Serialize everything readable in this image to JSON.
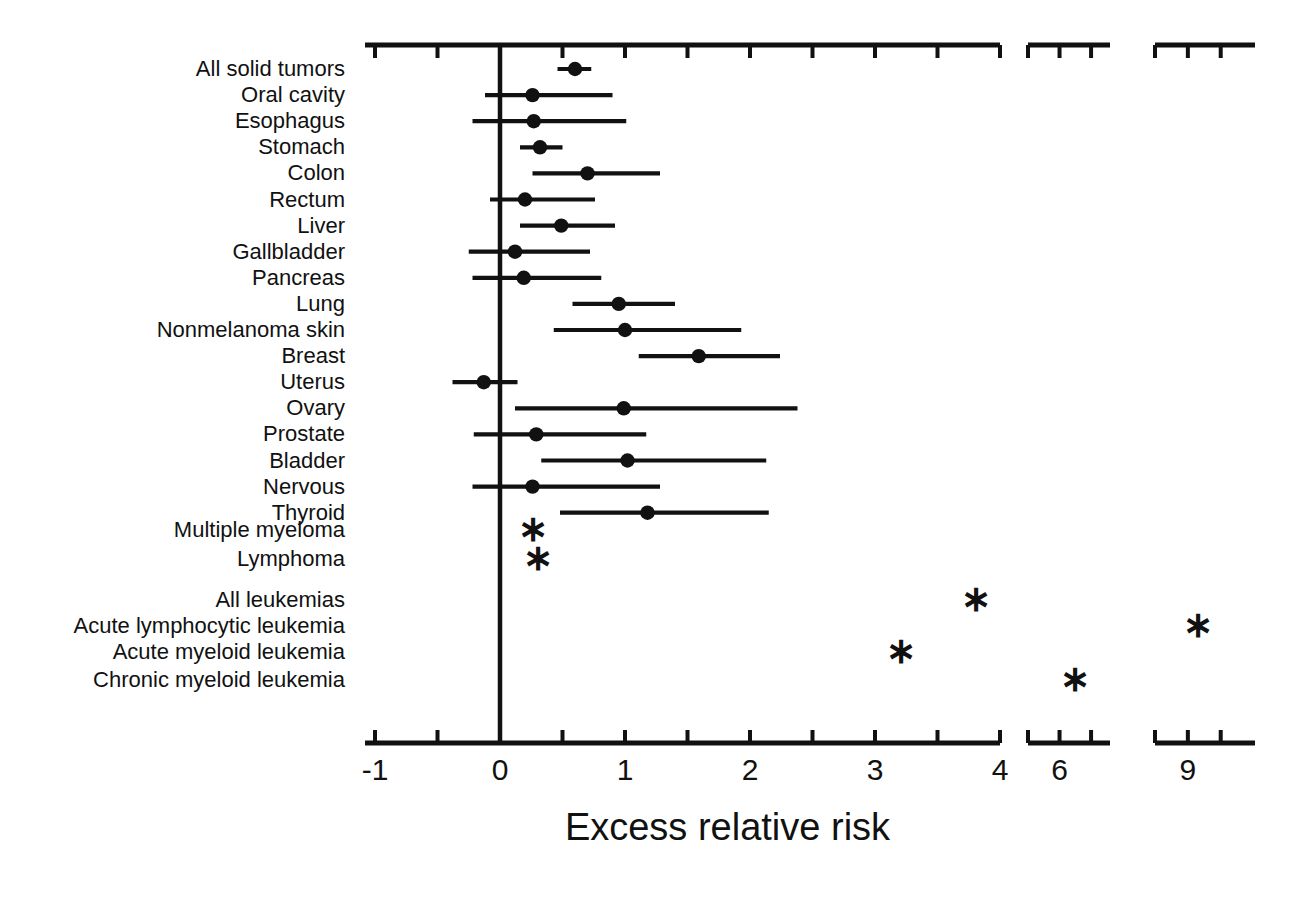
{
  "chart_data": {
    "type": "forest",
    "title": "",
    "xlabel": "Excess relative risk",
    "ylabel": "",
    "xlim": [
      -1.35,
      10.1
    ],
    "grid": false,
    "legend": null,
    "axis_note": "broken x-axis: continuous -1 to 4, gap, 5.6 to 6.8, gap, 8.6 to 9.9",
    "x_ticks_major": [
      "-1",
      "0",
      "1",
      "2",
      "3",
      "4",
      "6",
      "9"
    ],
    "x_ticks_major_values": [
      -1,
      0,
      1,
      2,
      3,
      4,
      6,
      9
    ],
    "x_ticks_minor_values": [
      -0.5,
      0.5,
      1.5,
      2.5,
      3.5,
      5.5,
      6.5,
      8.5,
      9.5
    ],
    "reference_line": 0,
    "marker_point": "filled-circle",
    "marker_censored": "asterisk",
    "points": [
      {
        "label": "All solid tumors",
        "value": 0.6,
        "low": 0.46,
        "high": 0.73,
        "censored": false
      },
      {
        "label": "Oral cavity",
        "value": 0.26,
        "low": -0.12,
        "high": 0.9,
        "censored": false
      },
      {
        "label": "Esophagus",
        "value": 0.27,
        "low": -0.22,
        "high": 1.01,
        "censored": false
      },
      {
        "label": "Stomach",
        "value": 0.32,
        "low": 0.16,
        "high": 0.5,
        "censored": false
      },
      {
        "label": "Colon",
        "value": 0.7,
        "low": 0.26,
        "high": 1.28,
        "censored": false
      },
      {
        "label": "Rectum",
        "value": 0.2,
        "low": -0.08,
        "high": 0.76,
        "censored": false
      },
      {
        "label": "Liver",
        "value": 0.49,
        "low": 0.16,
        "high": 0.92,
        "censored": false
      },
      {
        "label": "Gallbladder",
        "value": 0.12,
        "low": -0.25,
        "high": 0.72,
        "censored": false
      },
      {
        "label": "Pancreas",
        "value": 0.19,
        "low": -0.22,
        "high": 0.81,
        "censored": false
      },
      {
        "label": "Lung",
        "value": 0.95,
        "low": 0.58,
        "high": 1.4,
        "censored": false
      },
      {
        "label": "Nonmelanoma skin",
        "value": 1.0,
        "low": 0.43,
        "high": 1.93,
        "censored": false
      },
      {
        "label": "Breast",
        "value": 1.59,
        "low": 1.11,
        "high": 2.24,
        "censored": false
      },
      {
        "label": "Uterus",
        "value": -0.13,
        "low": -0.38,
        "high": 0.14,
        "censored": false
      },
      {
        "label": "Ovary",
        "value": 0.99,
        "low": 0.12,
        "high": 2.38,
        "censored": false
      },
      {
        "label": "Prostate",
        "value": 0.29,
        "low": -0.21,
        "high": 1.17,
        "censored": false
      },
      {
        "label": "Bladder",
        "value": 1.02,
        "low": 0.33,
        "high": 2.13,
        "censored": false
      },
      {
        "label": "Nervous",
        "value": 0.26,
        "low": -0.22,
        "high": 1.28,
        "censored": false
      },
      {
        "label": "Thyroid",
        "value": 1.18,
        "low": 0.48,
        "high": 2.15,
        "censored": false
      },
      {
        "label": "Multiple myeloma",
        "value": 0.26,
        "low": null,
        "high": null,
        "censored": true
      },
      {
        "label": "Lymphoma",
        "value": 0.3,
        "low": null,
        "high": null,
        "censored": true
      },
      {
        "label": "All leukemias",
        "value": 3.81,
        "low": null,
        "high": null,
        "censored": true
      },
      {
        "label": "Acute lymphocytic leukemia",
        "value": 9.15,
        "low": null,
        "high": null,
        "censored": true
      },
      {
        "label": "Acute myeloid leukemia",
        "value": 3.21,
        "low": null,
        "high": null,
        "censored": true
      },
      {
        "label": "Chronic myeloid leukemia",
        "value": 6.25,
        "low": null,
        "high": null,
        "censored": true
      }
    ]
  },
  "axis": {
    "title": "Excess relative risk",
    "tick_labels": [
      "-1",
      "0",
      "1",
      "2",
      "3",
      "4",
      "6",
      "9"
    ]
  },
  "rows": [
    {
      "label": "All solid tumors"
    },
    {
      "label": "Oral cavity"
    },
    {
      "label": "Esophagus"
    },
    {
      "label": "Stomach"
    },
    {
      "label": "Colon"
    },
    {
      "label": "Rectum"
    },
    {
      "label": "Liver"
    },
    {
      "label": "Gallbladder"
    },
    {
      "label": "Pancreas"
    },
    {
      "label": "Lung"
    },
    {
      "label": "Nonmelanoma skin"
    },
    {
      "label": "Breast"
    },
    {
      "label": "Uterus"
    },
    {
      "label": "Ovary"
    },
    {
      "label": "Prostate"
    },
    {
      "label": "Bladder"
    },
    {
      "label": "Nervous"
    },
    {
      "label": "Thyroid"
    },
    {
      "label": "Multiple myeloma"
    },
    {
      "label": "Lymphoma"
    },
    {
      "label": "All leukemias"
    },
    {
      "label": "Acute lymphocytic leukemia"
    },
    {
      "label": "Acute myeloid leukemia"
    },
    {
      "label": "Chronic myeloid leukemia"
    }
  ],
  "colors": {
    "ink": "#111111",
    "background": "#ffffff"
  }
}
